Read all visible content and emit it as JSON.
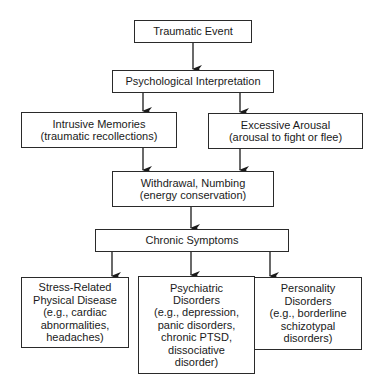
{
  "diagram": {
    "type": "flowchart",
    "nodes": {
      "traumatic_event": {
        "lines": [
          "Traumatic Event"
        ]
      },
      "psych_interpretation": {
        "lines": [
          "Psychological Interpretation"
        ]
      },
      "intrusive_memories": {
        "lines": [
          "Intrusive Memories",
          "(traumatic recollections)"
        ]
      },
      "excessive_arousal": {
        "lines": [
          "Excessive Arousal",
          "(arousal to fight or flee)"
        ]
      },
      "withdrawal_numbing": {
        "lines": [
          "Withdrawal, Numbing",
          "(energy conservation)"
        ]
      },
      "chronic_symptoms": {
        "lines": [
          "Chronic Symptoms"
        ]
      },
      "stress_physical": {
        "lines": [
          "Stress-Related",
          "Physical Disease",
          "(e.g., cardiac",
          "abnormalities,",
          "headaches)"
        ]
      },
      "psychiatric": {
        "lines": [
          "Psychiatric",
          "Disorders",
          "(e.g., depression,",
          "panic disorders,",
          "chronic PTSD,",
          "dissociative",
          "disorder)"
        ]
      },
      "personality": {
        "lines": [
          "Personality",
          "Disorders",
          "(e.g., borderline",
          "schizotypal",
          "disorders)"
        ]
      }
    },
    "edges": [
      [
        "traumatic_event",
        "psych_interpretation"
      ],
      [
        "psych_interpretation",
        "intrusive_memories"
      ],
      [
        "psych_interpretation",
        "excessive_arousal"
      ],
      [
        "intrusive_memories",
        "withdrawal_numbing"
      ],
      [
        "excessive_arousal",
        "withdrawal_numbing"
      ],
      [
        "withdrawal_numbing",
        "chronic_symptoms"
      ],
      [
        "chronic_symptoms",
        "stress_physical"
      ],
      [
        "chronic_symptoms",
        "psychiatric"
      ],
      [
        "chronic_symptoms",
        "personality"
      ]
    ]
  }
}
